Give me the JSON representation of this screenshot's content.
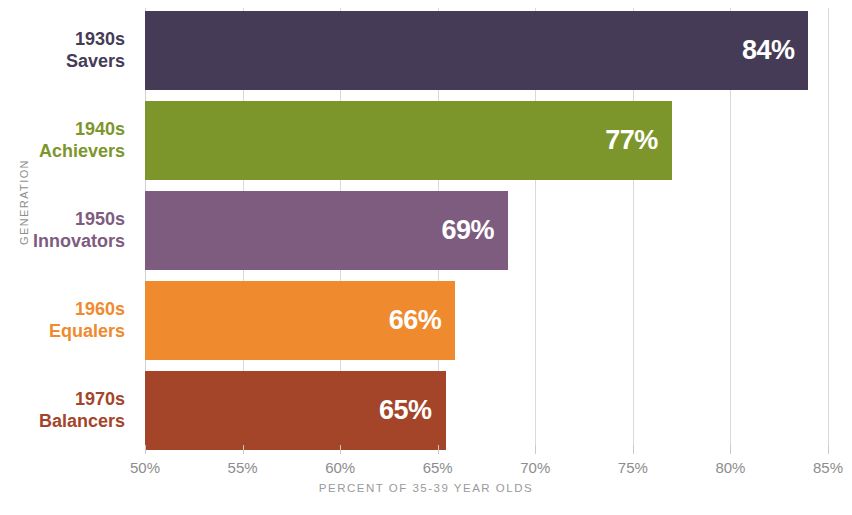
{
  "chart_data": {
    "type": "bar",
    "orientation": "horizontal",
    "title": "",
    "xlabel": "PERCENT OF 35-39 YEAR OLDS",
    "ylabel": "GENERATION",
    "xlim": [
      50,
      85
    ],
    "xticks": [
      "50%",
      "55%",
      "60%",
      "65%",
      "70%",
      "75%",
      "80%",
      "85%"
    ],
    "xtick_values": [
      50,
      55,
      60,
      65,
      70,
      75,
      80,
      85
    ],
    "grid": true,
    "legend": "none",
    "categories": [
      "1930s Savers",
      "1940s Achievers",
      "1950s Innovators",
      "1960s Equalers",
      "1970s Balancers"
    ],
    "values": [
      84,
      77,
      69,
      66,
      65
    ],
    "bars": [
      {
        "decade": "1930s",
        "name": "Savers",
        "value": 84,
        "value_label": "84%",
        "color": "#463B56"
      },
      {
        "decade": "1940s",
        "name": "Achievers",
        "value": 77,
        "value_label": "77%",
        "color": "#7D962B"
      },
      {
        "decade": "1950s",
        "name": "Innovators",
        "value": 68.6,
        "value_label": "69%",
        "color": "#7E5C80"
      },
      {
        "decade": "1960s",
        "name": "Equalers",
        "value": 65.9,
        "value_label": "66%",
        "color": "#F08A2E"
      },
      {
        "decade": "1970s",
        "name": "Balancers",
        "value": 65.4,
        "value_label": "65%",
        "color": "#A4452A"
      }
    ],
    "value_label_color": "#FFFFFF",
    "gridline_color": "#D9D9D9",
    "axis_text_color": "#8D8D8D",
    "background_color": "#FFFFFF"
  }
}
